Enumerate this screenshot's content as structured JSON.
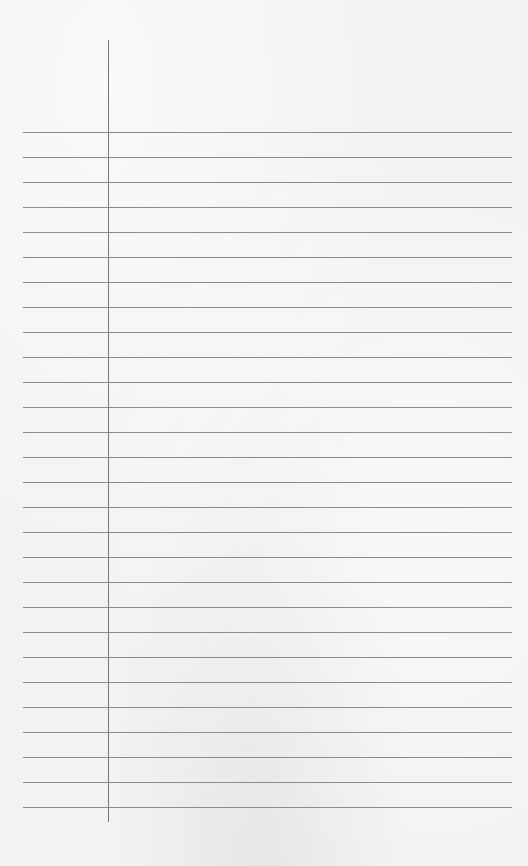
{
  "paper": {
    "type": "ruled-notebook-page",
    "line_color": "#8c8c8c",
    "margin_line_color": "#777777",
    "background_color": "#f2f2f0",
    "line_count": 28,
    "first_line_y": 132,
    "line_spacing": 25,
    "margin_x": 108
  }
}
